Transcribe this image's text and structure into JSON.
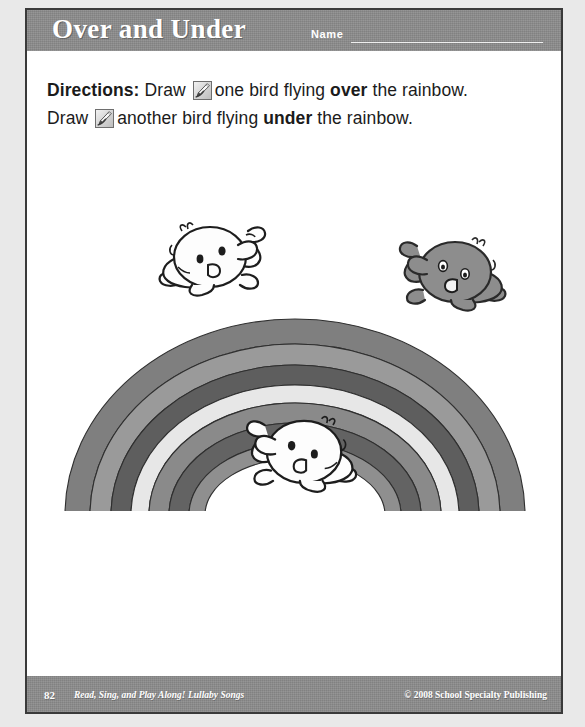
{
  "page": {
    "title": "Over and Under",
    "name_field": {
      "label": "Name",
      "value": "",
      "placeholder": ""
    }
  },
  "directions": {
    "lead_label": "Directions:",
    "line1_before_icon": " Draw ",
    "line1_after_icon": "one bird flying ",
    "line1_emphasis": "over",
    "line1_tail": " the rainbow.",
    "line2_before_icon": "Draw ",
    "line2_after_icon": "another bird flying ",
    "line2_emphasis": "under",
    "line2_tail": " the rainbow.",
    "icon_name": "pencil-draw-icon"
  },
  "artwork": {
    "rainbow": {
      "name": "rainbow-arc",
      "bands": [
        {
          "label": "band-1-outer",
          "color": "#7f7f7f"
        },
        {
          "label": "band-2",
          "color": "#9a9a9a"
        },
        {
          "label": "band-3",
          "color": "#5e5e5e"
        },
        {
          "label": "band-4",
          "color": "#e7e7e7"
        },
        {
          "label": "band-5",
          "color": "#8a8a8a"
        },
        {
          "label": "band-6",
          "color": "#636363"
        },
        {
          "label": "band-7-inner",
          "color": "#8f8f8f"
        }
      ],
      "outline_color": "#2f2f2f"
    },
    "birds": [
      {
        "name": "bird-over-left",
        "shade": "light",
        "facing": "left",
        "position": "above-rainbow-left"
      },
      {
        "name": "bird-over-right",
        "shade": "dark",
        "facing": "right",
        "position": "above-rainbow-right"
      },
      {
        "name": "bird-under",
        "shade": "light",
        "facing": "right",
        "position": "under-rainbow-center"
      }
    ]
  },
  "footer": {
    "page_number": "82",
    "book_title": "Read, Sing, and Play Along! Lullaby Songs",
    "copyright": "© 2008 School Specialty Publishing"
  },
  "colors": {
    "banner_gray": "#8c8c8c",
    "page_white": "#ffffff",
    "border_dark": "#3a3a3a",
    "outer_margin": "#e9e9e9",
    "text_dark": "#1b1b1b"
  }
}
